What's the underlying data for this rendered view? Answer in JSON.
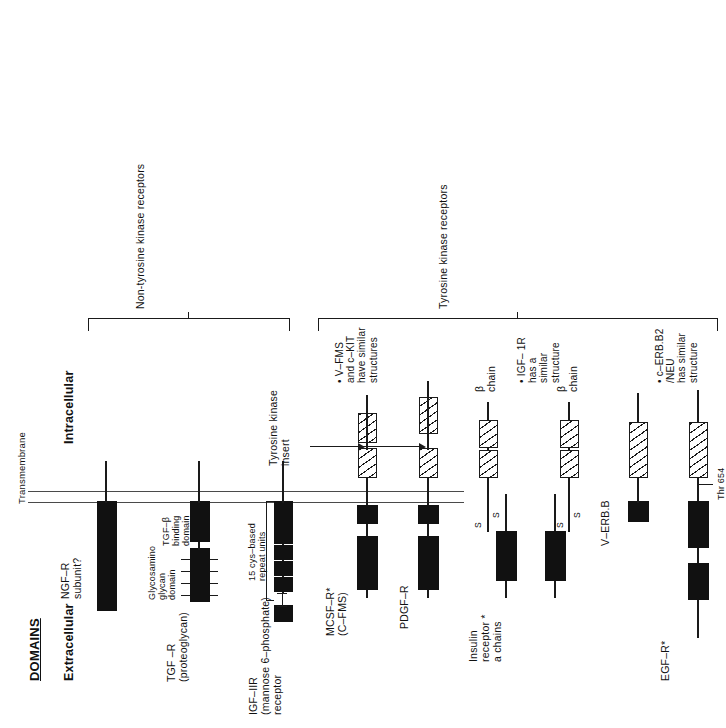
{
  "figure": {
    "title": "DOMAINS",
    "region_labels": {
      "extracellular": "Extracellular",
      "transmembrane": "Transmembrane",
      "intracellular": "Intracellular"
    },
    "annotations": {
      "tyrosine_kinase_insert": "Tyrosine kinase\ninsert",
      "thr654": "Thr 654"
    },
    "group_brackets": [
      {
        "label": "Non-tyrosine kinase receptors"
      },
      {
        "label": "Tyrosine kinase receptors"
      }
    ]
  },
  "receptors": [
    {
      "id": "ngf-r",
      "name": "NGF–R\nsubunit?",
      "class": "non-tyrosine-kinase"
    },
    {
      "id": "tgf-r",
      "name": "TGF –R\n(proteoglycan)",
      "class": "non-tyrosine-kinase",
      "domain_labels": [
        "Glycosamino\nglycan\ndomain",
        "TGF–β\nbinding\ndomain"
      ]
    },
    {
      "id": "igf-iir",
      "name": "IGF–IIR\n(mannose 6–phosphate)\nreceptor",
      "class": "non-tyrosine-kinase",
      "domain_labels": [
        "15 cys–based\nrepeat units"
      ],
      "repeat_count": 8
    },
    {
      "id": "mcsf-r",
      "name": "MCSF–R*\n(C–FMS)",
      "class": "tyrosine-kinase"
    },
    {
      "id": "pdgf-r",
      "name": "PDGF–R",
      "class": "tyrosine-kinase"
    },
    {
      "id": "insulin-receptor",
      "name": "Insulin\nreceptor *\na chains",
      "class": "tyrosine-kinase",
      "chain_labels": [
        "β\nchain",
        "β\nchain"
      ],
      "disulfide_labels": [
        "S",
        "S",
        "S",
        "S"
      ]
    },
    {
      "id": "v-erb-b",
      "name": "V–ERB.B",
      "class": "tyrosine-kinase"
    },
    {
      "id": "egf-r",
      "name": "EGF–R*",
      "class": "tyrosine-kinase"
    }
  ],
  "footnotes": [
    {
      "id": "note-v-fms",
      "text": "• V–FMS\nand c–KIT\nhave similar\nstructures"
    },
    {
      "id": "note-igf-1r",
      "text": "• IGF– 1R\nhas a\nsimilar\nstructure"
    },
    {
      "id": "note-c-erb-b2",
      "text": "• c–ERB.B2\n/NEU\nhas similar\nstructure"
    }
  ]
}
